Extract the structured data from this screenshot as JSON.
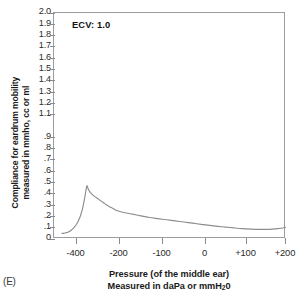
{
  "panel_label": "(E)",
  "annotation": {
    "text": "ECV: 1.0"
  },
  "axes": {
    "ylabel_line1": "Compliance for eardrum mobility",
    "ylabel_line2": "measured in mmho, cc or ml",
    "xlabel_line1": "Pressure (of the middle ear)",
    "xlabel_line2_pre": "Measured in daPa or mmH",
    "xlabel_line2_sub": "2",
    "xlabel_line2_post": "0"
  },
  "chart_data": {
    "type": "line",
    "title": "",
    "subtitle": "",
    "annotations": [
      {
        "text": "ECV: 1.0",
        "x": -430,
        "y": 1.9
      }
    ],
    "xlabel": "Pressure (of the middle ear) Measured in daPa or mmH20",
    "ylabel": "Compliance for eardrum mobility measured in mmho, cc or ml",
    "grid": false,
    "legend": "none",
    "xlim": [
      -470,
      230
    ],
    "ylim": [
      0,
      2.0
    ],
    "xticks": [
      -400,
      -200,
      -100,
      0,
      100,
      200
    ],
    "xticklabels": [
      "-400",
      "-200",
      "-100",
      "0",
      "+100",
      "+200"
    ],
    "yticks": [
      0,
      0.1,
      0.2,
      0.3,
      0.4,
      0.5,
      0.6,
      0.7,
      0.8,
      0.9,
      1.1,
      1.2,
      1.3,
      1.4,
      1.5,
      1.6,
      1.7,
      1.8,
      1.9,
      2.0
    ],
    "yticklabels": [
      "0",
      ".1",
      ".2",
      ".3",
      ".4",
      ".5",
      ".6",
      ".7",
      ".8",
      ".9",
      "1.1",
      "1.2",
      "1.3",
      "1.4",
      "1.5",
      "1.6",
      "1.7",
      "1.8",
      "1.9",
      "2.0"
    ],
    "ytick_note": "label for 1.0 is absent in the source figure",
    "series": [
      {
        "name": "tympanogram",
        "color": "#8d8d8d",
        "x": [
          -468,
          -460,
          -450,
          -440,
          -430,
          -420,
          -410,
          -400,
          -390,
          -380,
          -370,
          -360,
          -352,
          -345,
          -335,
          -325,
          -315,
          -300,
          -285,
          -270,
          -250,
          -230,
          -210,
          -190,
          -170,
          -150,
          -130,
          -110,
          -90,
          -70,
          -50,
          -30,
          -10,
          10,
          30,
          50,
          70,
          90,
          110,
          130,
          150,
          165,
          180,
          195,
          205
        ],
        "y": [
          0.05,
          0.05,
          0.055,
          0.06,
          0.07,
          0.085,
          0.105,
          0.13,
          0.165,
          0.215,
          0.285,
          0.385,
          0.47,
          0.44,
          0.41,
          0.39,
          0.375,
          0.355,
          0.335,
          0.315,
          0.29,
          0.27,
          0.25,
          0.235,
          0.22,
          0.205,
          0.19,
          0.18,
          0.17,
          0.16,
          0.15,
          0.14,
          0.13,
          0.12,
          0.112,
          0.105,
          0.098,
          0.092,
          0.088,
          0.085,
          0.085,
          0.087,
          0.092,
          0.1,
          0.108
        ]
      }
    ]
  }
}
